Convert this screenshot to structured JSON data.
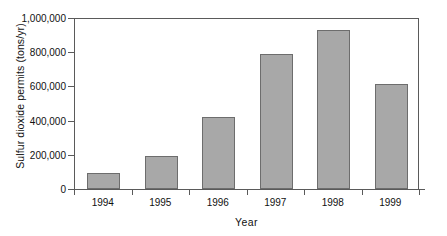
{
  "chart_data": {
    "type": "bar",
    "title": "",
    "xlabel": "Year",
    "ylabel": "Sulfur dioxide permits (tons/yr)",
    "categories": [
      "1994",
      "1995",
      "1996",
      "1997",
      "1998",
      "1999"
    ],
    "values": [
      93000,
      195000,
      420000,
      790000,
      930000,
      613000
    ],
    "ylim": [
      0,
      1000000
    ],
    "yticks": [
      0,
      200000,
      400000,
      600000,
      800000,
      1000000
    ],
    "ytick_labels": [
      "0",
      "200,000",
      "400,000",
      "600,000",
      "800,000",
      "1,000,000"
    ],
    "grid": false,
    "legend": "none",
    "bar_color": "#a8a8a8",
    "bar_edge_color": "#6d6d6d",
    "axis_color": "#5a5a5a",
    "text_color": "#111111"
  }
}
